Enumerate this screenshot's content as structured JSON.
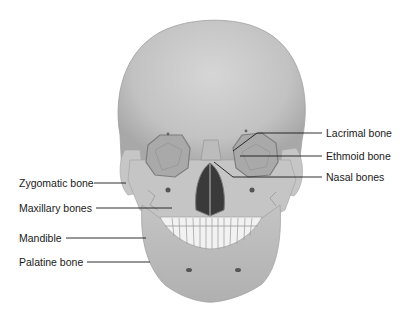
{
  "diagram": {
    "labels_left": [
      {
        "text": "Zygomatic bone",
        "x": 19,
        "y": 177
      },
      {
        "text": "Maxillary bones",
        "x": 19,
        "y": 202
      },
      {
        "text": "Mandible",
        "x": 19,
        "y": 232
      },
      {
        "text": "Palatine bone",
        "x": 19,
        "y": 256
      }
    ],
    "labels_right": [
      {
        "text": "Lacrimal bone",
        "x": 326,
        "y": 128
      },
      {
        "text": "Ethmoid bone",
        "x": 326,
        "y": 151
      },
      {
        "text": "Nasal bones",
        "x": 326,
        "y": 172
      }
    ],
    "colors": {
      "bone": "#c8c8c8",
      "bone_shadow": "#9a9a9a",
      "cavity": "#3a3a3a",
      "leader_line": "#1a1a1a"
    }
  }
}
